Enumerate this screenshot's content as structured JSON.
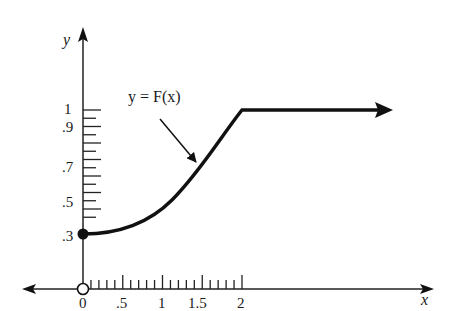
{
  "chart_data": {
    "type": "line",
    "title": "",
    "xlabel": "x",
    "ylabel": "y",
    "annotation": "y = F(x)",
    "x_ticks_labeled": [
      "0",
      ".5",
      "1",
      "1.5",
      "2"
    ],
    "y_ticks_labeled": [
      ".3",
      ".5",
      ".7",
      ".9",
      "1"
    ],
    "x_minor_tick_step": 0.1,
    "y_minor_tick_step": 0.05,
    "xlim": [
      0,
      2
    ],
    "ylim": [
      0,
      1
    ],
    "series": [
      {
        "name": "F(x)",
        "x": [
          0,
          0.25,
          0.5,
          0.75,
          1.0,
          1.25,
          1.5,
          1.75,
          2.0,
          4.0
        ],
        "values": [
          0.3,
          0.31,
          0.34,
          0.4,
          0.47,
          0.56,
          0.68,
          0.84,
          1.0,
          1.0
        ],
        "extends_right_arrow": true
      }
    ],
    "markers": [
      {
        "x": 0,
        "y": 0.3,
        "style": "filled"
      },
      {
        "x": 0,
        "y": 0,
        "style": "open"
      }
    ],
    "grid": false,
    "legend": "none"
  },
  "labels": {
    "y_axis": "y",
    "x_axis": "x",
    "curve": "y = F(x)",
    "x0": "0",
    "x05": ".5",
    "x1": "1",
    "x15": "1.5",
    "x2": "2",
    "y3": ".3",
    "y5": ".5",
    "y7": ".7",
    "y9": ".9",
    "y1": "1"
  }
}
